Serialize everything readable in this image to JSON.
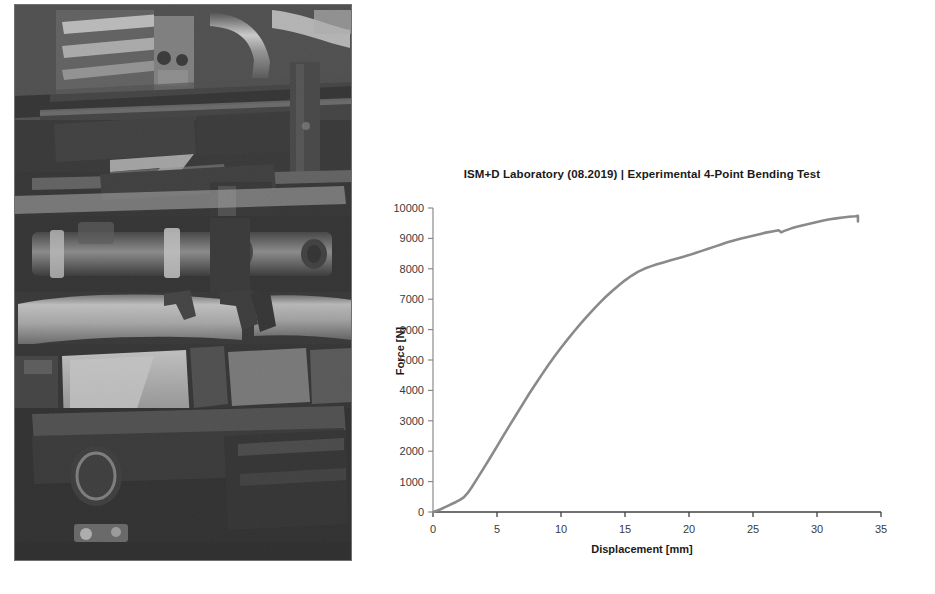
{
  "photo": {
    "name": "four-point-bending-test-rig-photo",
    "description": "Grayscale photograph of a laboratory 4-point bending test setup with steel beams, hydraulic cylinder, loading rollers and support frame",
    "background_color": "#2b2b2b"
  },
  "chart_data": {
    "type": "line",
    "title": "ISM+D Laboratory (08.2019) | Experimental 4-Point Bending Test",
    "xlabel": "Displacement [mm]",
    "ylabel": "Force [N]",
    "xlim": [
      0,
      35
    ],
    "ylim": [
      0,
      10000
    ],
    "xticks": [
      0,
      5,
      10,
      15,
      20,
      25,
      30,
      35
    ],
    "yticks": [
      0,
      1000,
      2000,
      3000,
      4000,
      5000,
      6000,
      7000,
      8000,
      9000,
      10000
    ],
    "grid": false,
    "legend": "none",
    "series_color": "#8a8a8a",
    "series": [
      {
        "name": "Force-Displacement",
        "x": [
          0.0,
          0.3,
          0.6,
          0.9,
          1.2,
          1.5,
          1.8,
          2.1,
          2.4,
          2.7,
          3.0,
          3.5,
          4.0,
          4.5,
          5.0,
          5.5,
          6.0,
          6.5,
          7.0,
          7.5,
          8.0,
          8.5,
          9.0,
          9.5,
          10.0,
          10.5,
          11.0,
          11.5,
          12.0,
          12.5,
          13.0,
          13.5,
          14.0,
          14.5,
          15.0,
          15.5,
          16.0,
          16.5,
          17.0,
          17.5,
          18.0,
          18.5,
          19.0,
          19.5,
          20.0,
          20.5,
          21.0,
          21.5,
          22.0,
          22.5,
          23.0,
          23.5,
          24.0,
          24.5,
          25.0,
          25.5,
          26.0,
          26.5,
          27.0,
          27.2,
          27.4,
          28.0,
          28.5,
          29.0,
          29.5,
          30.0,
          30.5,
          31.0,
          31.5,
          32.0,
          32.5,
          33.0,
          33.2,
          33.2
        ],
        "y": [
          0,
          40,
          90,
          150,
          210,
          270,
          330,
          400,
          480,
          620,
          800,
          1130,
          1470,
          1810,
          2160,
          2510,
          2860,
          3200,
          3540,
          3880,
          4200,
          4520,
          4830,
          5120,
          5400,
          5670,
          5930,
          6180,
          6420,
          6650,
          6870,
          7080,
          7270,
          7450,
          7620,
          7770,
          7900,
          8000,
          8080,
          8150,
          8210,
          8270,
          8330,
          8390,
          8450,
          8520,
          8590,
          8660,
          8730,
          8800,
          8870,
          8930,
          8990,
          9040,
          9090,
          9140,
          9190,
          9230,
          9270,
          9200,
          9240,
          9330,
          9390,
          9440,
          9490,
          9540,
          9590,
          9630,
          9660,
          9690,
          9710,
          9730,
          9740,
          9560
        ]
      }
    ],
    "annotations": [
      {
        "text": "sharp load drop at end of test",
        "x": 33.2,
        "y": 9560
      }
    ]
  }
}
